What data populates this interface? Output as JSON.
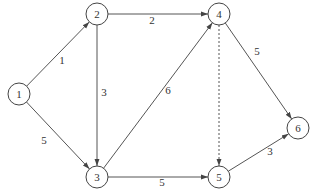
{
  "diagram": {
    "type": "directed-network",
    "nodes": [
      {
        "id": "1",
        "label": "1",
        "x": 19,
        "y": 94
      },
      {
        "id": "2",
        "label": "2",
        "x": 97,
        "y": 14
      },
      {
        "id": "3",
        "label": "3",
        "x": 97,
        "y": 177
      },
      {
        "id": "4",
        "label": "4",
        "x": 219,
        "y": 14
      },
      {
        "id": "5",
        "label": "5",
        "x": 219,
        "y": 177
      },
      {
        "id": "6",
        "label": "6",
        "x": 298,
        "y": 128
      }
    ],
    "edges": [
      {
        "from": "1",
        "to": "2",
        "weight": "1",
        "style": "solid",
        "lx": 62,
        "ly": 64
      },
      {
        "from": "1",
        "to": "3",
        "weight": "5",
        "style": "solid",
        "lx": 44,
        "ly": 144
      },
      {
        "from": "2",
        "to": "4",
        "weight": "2",
        "style": "solid",
        "lx": 152,
        "ly": 24
      },
      {
        "from": "2",
        "to": "3",
        "weight": "3",
        "style": "solid",
        "lx": 104,
        "ly": 96
      },
      {
        "from": "3",
        "to": "4",
        "weight": "6",
        "style": "solid",
        "lx": 168,
        "ly": 94
      },
      {
        "from": "4",
        "to": "6",
        "weight": "5",
        "style": "solid",
        "lx": 257,
        "ly": 55
      },
      {
        "from": "4",
        "to": "5",
        "weight": "",
        "style": "dashed",
        "lx": 0,
        "ly": 0
      },
      {
        "from": "3",
        "to": "5",
        "weight": "5",
        "style": "solid",
        "lx": 162,
        "ly": 186
      },
      {
        "from": "5",
        "to": "6",
        "weight": "3",
        "style": "solid",
        "lx": 270,
        "ly": 155
      }
    ],
    "node_radius": 11
  }
}
